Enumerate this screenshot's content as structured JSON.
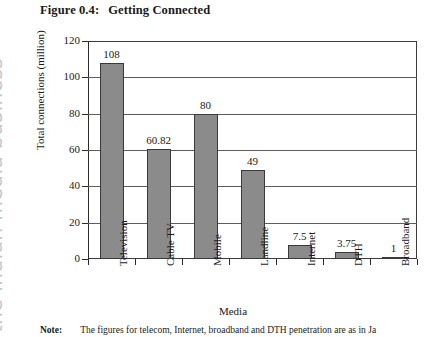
{
  "watermark": {
    "text": "the indian media business"
  },
  "figure": {
    "number": "Figure 0.4:",
    "title": "Getting Connected"
  },
  "note": {
    "label": "Note:",
    "text": "The figures for telecom, Internet, broadband and DTH penetration are as in Ja"
  },
  "chart_data": {
    "type": "bar",
    "title": "Getting Connected",
    "xlabel": "Media",
    "ylabel": "Total connections (million)",
    "categories": [
      "Television",
      "Cable TV",
      "Mobile",
      "Landline",
      "Internet",
      "DTH",
      "Broadband"
    ],
    "values": [
      108,
      60.82,
      80,
      49,
      7.5,
      3.75,
      1
    ],
    "data_labels": [
      "108",
      "60.82",
      "80",
      "49",
      "7.5",
      "3.75",
      "1"
    ],
    "ylim": [
      0,
      120
    ],
    "yticks": [
      0,
      20,
      40,
      60,
      80,
      100,
      120
    ],
    "ytick_labels": [
      "0",
      "20",
      "40",
      "60",
      "80",
      "100",
      "120"
    ],
    "grid": true,
    "legend": false,
    "bar_color": "#8b8b8b",
    "bar_edge_color": "#3a3a3a"
  }
}
